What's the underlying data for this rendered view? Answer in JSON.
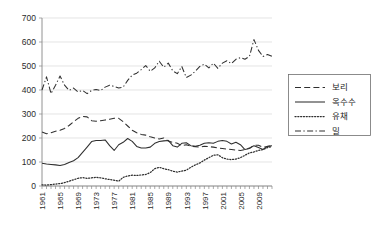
{
  "chart_data": {
    "type": "line",
    "title": "",
    "xlabel": "",
    "ylabel": "",
    "ylim": [
      0,
      700
    ],
    "yticks": [
      0,
      100,
      200,
      300,
      400,
      500,
      600,
      700
    ],
    "xlim": [
      1961,
      2012
    ],
    "grid": true,
    "legend_position": "right",
    "x": [
      1961,
      1962,
      1963,
      1964,
      1965,
      1966,
      1967,
      1968,
      1969,
      1970,
      1971,
      1972,
      1973,
      1974,
      1975,
      1976,
      1977,
      1978,
      1979,
      1980,
      1981,
      1982,
      1983,
      1984,
      1985,
      1986,
      1987,
      1988,
      1989,
      1990,
      1991,
      1992,
      1993,
      1994,
      1995,
      1996,
      1997,
      1998,
      1999,
      2000,
      2001,
      2002,
      2003,
      2004,
      2005,
      2006,
      2007,
      2008,
      2009,
      2010,
      2011,
      2012
    ],
    "xtick_labels": [
      "1961",
      "1965",
      "1969",
      "1973",
      "1977",
      "1981",
      "1985",
      "1989",
      "1993",
      "1997",
      "2001",
      "2005",
      "2009"
    ],
    "series": [
      {
        "name": "보리",
        "style": "dashed",
        "values": [
          225,
          218,
          222,
          228,
          232,
          240,
          252,
          268,
          282,
          290,
          288,
          272,
          270,
          272,
          275,
          278,
          282,
          282,
          268,
          250,
          232,
          222,
          215,
          212,
          205,
          200,
          196,
          200,
          188,
          182,
          178,
          168,
          172,
          166,
          164,
          162,
          166,
          164,
          162,
          158,
          156,
          154,
          152,
          150,
          148,
          152,
          158,
          170,
          170,
          162,
          165,
          168
        ]
      },
      {
        "name": "옥수수",
        "style": "solid",
        "values": [
          95,
          92,
          90,
          88,
          85,
          90,
          98,
          105,
          118,
          140,
          162,
          185,
          190,
          190,
          192,
          168,
          148,
          172,
          182,
          198,
          186,
          165,
          158,
          158,
          162,
          178,
          185,
          188,
          190,
          168,
          162,
          178,
          180,
          168,
          166,
          170,
          178,
          180,
          178,
          186,
          190,
          186,
          175,
          182,
          172,
          152,
          156,
          168,
          160,
          152,
          166,
          168
        ]
      },
      {
        "name": "유채",
        "style": "dotted",
        "values": [
          5,
          4,
          6,
          8,
          10,
          14,
          20,
          26,
          32,
          35,
          32,
          34,
          36,
          34,
          30,
          27,
          24,
          20,
          36,
          42,
          45,
          44,
          46,
          48,
          56,
          72,
          78,
          72,
          68,
          62,
          58,
          62,
          66,
          78,
          88,
          96,
          108,
          118,
          128,
          130,
          118,
          112,
          110,
          112,
          118,
          128,
          138,
          142,
          148,
          152,
          160,
          165
        ]
      },
      {
        "name": "밀",
        "style": "dashdot",
        "values": [
          400,
          455,
          385,
          420,
          458,
          420,
          398,
          408,
          392,
          398,
          385,
          398,
          402,
          398,
          412,
          420,
          415,
          408,
          412,
          440,
          462,
          470,
          485,
          502,
          478,
          492,
          520,
          495,
          512,
          480,
          468,
          498,
          452,
          462,
          478,
          498,
          508,
          492,
          512,
          490,
          512,
          522,
          510,
          528,
          535,
          528,
          540,
          610,
          565,
          540,
          548,
          540
        ]
      }
    ]
  },
  "legend": {
    "items": [
      {
        "label": "보리",
        "style": "dashed"
      },
      {
        "label": "옥수수",
        "style": "solid"
      },
      {
        "label": "유채",
        "style": "dotted"
      },
      {
        "label": "밀",
        "style": "dashdot"
      }
    ]
  },
  "colors": {
    "line": "#2f2f2f",
    "grid": "#d9d9d9",
    "axis": "#868686",
    "text": "#1a1a1a",
    "background": "#ffffff"
  }
}
